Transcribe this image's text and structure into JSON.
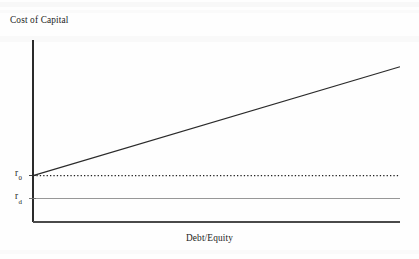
{
  "figure": {
    "background_color": "#fefefe",
    "ink_color": "#1c1c1c"
  },
  "chart_data": {
    "type": "line",
    "title": "",
    "subtitle": "",
    "xlabel": "Debt/Equity",
    "ylabel": "Cost of Capital",
    "xlim": [
      0,
      1
    ],
    "ylim": [
      0,
      1
    ],
    "grid": false,
    "legend": "none",
    "axis_ticks": {
      "x": [],
      "y": [
        "r0",
        "rd"
      ]
    },
    "tick_labels": {
      "r0_text": "r",
      "r0_sub": "0",
      "rd_text": "r",
      "rd_sub": "d"
    },
    "annotations": [
      {
        "label": "r0",
        "text": "r0",
        "value": 0.255,
        "note": "cost of capital / unlevered required return intercept"
      },
      {
        "label": "rd",
        "text": "rd",
        "value": 0.128,
        "note": "cost of debt, constant"
      }
    ],
    "series": [
      {
        "name": "Cost of equity (levered)",
        "style": "solid",
        "color": "#2a2a2a",
        "x": [
          0.0,
          1.0
        ],
        "y": [
          0.255,
          0.853
        ],
        "slope_positive": true
      },
      {
        "name": "r0 (weighted average cost of capital)",
        "style": "dotted",
        "color": "#202020",
        "x": [
          0.0,
          1.0
        ],
        "y": [
          0.255,
          0.255
        ],
        "constant": true
      },
      {
        "name": "rd (cost of debt)",
        "style": "solid-thin",
        "color": "#8c8c8c",
        "x": [
          0.0,
          1.0
        ],
        "y": [
          0.128,
          0.128
        ],
        "constant": true
      }
    ]
  }
}
